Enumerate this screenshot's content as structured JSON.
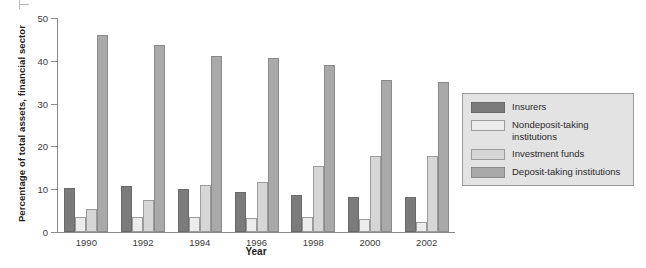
{
  "chart_data": {
    "type": "bar",
    "title": "",
    "subtitle": "",
    "xlabel": "Year",
    "ylabel": "Percentage of total assets, financial sector",
    "categories": [
      "1990",
      "1992",
      "1994",
      "1996",
      "1998",
      "2000",
      "2002"
    ],
    "ylim": [
      0,
      50
    ],
    "yticks": [
      0,
      10,
      20,
      30,
      40,
      50
    ],
    "ytick_labels": [
      "0",
      "10",
      "20",
      "30",
      "40",
      "50"
    ],
    "grid": false,
    "legend_position": "right",
    "series": [
      {
        "name": "Insurers",
        "color": "#7b7b7b",
        "values": [
          10.3,
          10.8,
          10.0,
          9.3,
          8.6,
          8.2,
          8.1
        ]
      },
      {
        "name": "Nondeposit-taking institutions",
        "color": "#ececec",
        "values": [
          3.4,
          3.6,
          3.4,
          3.2,
          3.4,
          3.0,
          2.3
        ]
      },
      {
        "name": "Investment funds",
        "color": "#d6d6d6",
        "values": [
          5.3,
          7.4,
          10.9,
          11.8,
          15.4,
          17.8,
          17.8
        ]
      },
      {
        "name": "Deposit-taking institutions",
        "color": "#a9a9a9",
        "values": [
          46.1,
          43.7,
          41.2,
          40.7,
          39.1,
          35.5,
          35.1
        ]
      }
    ]
  },
  "legend": {
    "items": [
      {
        "label": "Insurers",
        "color": "#7b7b7b"
      },
      {
        "label": "Nondeposit-taking institutions",
        "color": "#ececec"
      },
      {
        "label": "Investment funds",
        "color": "#d6d6d6"
      },
      {
        "label": "Deposit-taking institutions",
        "color": "#a9a9a9"
      }
    ]
  }
}
